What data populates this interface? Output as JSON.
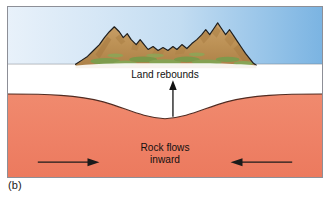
{
  "figure": {
    "panel_caption": "(b)",
    "domain_type": "geological-cross-section-diagram"
  },
  "labels": {
    "land_rebounds": "Land rebounds",
    "rock_flows_line1": "Rock flows",
    "rock_flows_line2": "inward"
  },
  "arrows": {
    "up_arrow_name": "land-rebound-up-arrow",
    "left_arrow_name": "rock-flow-right-pointing-arrow",
    "right_arrow_name": "rock-flow-left-pointing-arrow"
  },
  "layers": {
    "sky_label": "sky",
    "crust_label": "crust",
    "mantle_label": "mantle",
    "island_label": "island-landmass"
  },
  "colors": {
    "sky_left": "#e3eef9",
    "sky_mid": "#cfe2f4",
    "sky_right": "#7fb6e3",
    "crust_white": "#ffffff",
    "mantle_salmon": "#ef8267",
    "mantle_outline": "#4a2a22",
    "rock_brown_light": "#c79a62",
    "rock_brown_mid": "#b8894f",
    "rock_brown_dark": "#9d7440",
    "vegetation_green": "#7d9b4e",
    "outline_black": "#1a1a1a",
    "frame_border": "#8d8f97",
    "text_black": "#111111"
  },
  "geometry": {
    "sea_level_y": 64,
    "mantle_dip_center_x": 166,
    "mantle_dip_bottom_y": 120,
    "mantle_flank_y": 96
  }
}
